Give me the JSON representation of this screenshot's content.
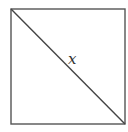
{
  "diagram": {
    "type": "square-with-diagonal",
    "shape": "square",
    "square": {
      "x": 11,
      "y": 9,
      "size": 114
    },
    "diagonal": {
      "from": "top-left",
      "to": "bottom-right"
    },
    "label": {
      "text": "x",
      "refers_to": "diagonal"
    },
    "stroke_color": "#444444",
    "background_color": "#ffffff"
  }
}
